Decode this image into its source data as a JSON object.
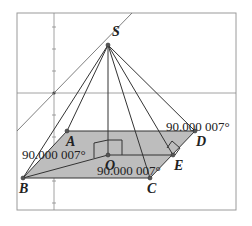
{
  "diagram": {
    "type": "pyramid-geometry-construction",
    "frame": {
      "x": 17,
      "y": 13,
      "width": 219,
      "height": 197,
      "stroke": "#9a9a9a"
    },
    "axes": {
      "vertical_x": 54,
      "horizontal_y": 93,
      "color": "#8a8a8a",
      "ticks_y": [
        27,
        49,
        71,
        115,
        137,
        159,
        181,
        203
      ]
    },
    "oblique_line": {
      "x1": 132,
      "y1": 13,
      "x2": 17,
      "y2": 131,
      "color": "#707070"
    },
    "base_fill": "#bdbdbd",
    "points": {
      "S": {
        "x": 108,
        "y": 45,
        "label": "S",
        "lx": 112,
        "ly": 36
      },
      "A": {
        "x": 67,
        "y": 131,
        "label": "A",
        "lx": 66,
        "ly": 146
      },
      "B": {
        "x": 23,
        "y": 178,
        "label": "B",
        "lx": 19,
        "ly": 193
      },
      "C": {
        "x": 150,
        "y": 178,
        "label": "C",
        "lx": 147,
        "ly": 193
      },
      "D": {
        "x": 195,
        "y": 131,
        "label": "D",
        "lx": 196,
        "ly": 146
      },
      "E": {
        "x": 173,
        "y": 155,
        "label": "E",
        "lx": 174,
        "ly": 170
      },
      "O": {
        "x": 108,
        "y": 155,
        "label": "O",
        "lx": 105,
        "ly": 170
      }
    },
    "base_polygon": [
      "A",
      "D",
      "C",
      "B"
    ],
    "apex_edges": [
      [
        "S",
        "B"
      ],
      [
        "S",
        "A"
      ],
      [
        "S",
        "O"
      ],
      [
        "S",
        "C"
      ],
      [
        "S",
        "E"
      ],
      [
        "S",
        "D"
      ]
    ],
    "base_segments": [
      [
        "B",
        "O"
      ],
      [
        "O",
        "E"
      ]
    ],
    "right_angle_marks": [
      {
        "at": "O",
        "points": "94,158 94,143 108,140 122,140 122,155"
      },
      {
        "at": "E",
        "points": "167,148 172,141 180,148 175,155"
      }
    ],
    "angle_labels": [
      {
        "text": "90.000 007°",
        "x": 22,
        "y": 159,
        "near": "A"
      },
      {
        "text": "90.000 007°",
        "x": 166,
        "y": 131,
        "near": "D"
      },
      {
        "text": "90.000 007°",
        "x": 97,
        "y": 175,
        "near": "C"
      }
    ]
  }
}
